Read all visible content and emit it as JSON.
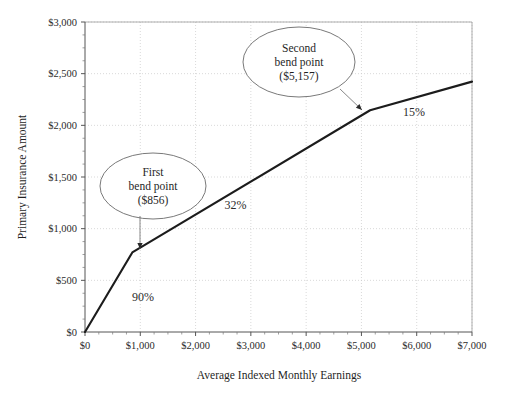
{
  "chart_data": {
    "type": "line",
    "title": "",
    "xlabel": "Average Indexed Monthly Earnings",
    "ylabel": "Primary Insurance Amount",
    "xlim": [
      0,
      7000
    ],
    "ylim": [
      0,
      3000
    ],
    "grid": true,
    "legend": "none",
    "x_tick_labels": [
      "$0",
      "$1,000",
      "$2,000",
      "$3,000",
      "$4,000",
      "$5,000",
      "$6,000",
      "$7,000"
    ],
    "x_tick_values": [
      0,
      1000,
      2000,
      3000,
      4000,
      5000,
      6000,
      7000
    ],
    "x_minor_step": 250,
    "y_tick_labels": [
      "$0",
      "$500",
      "$1,000",
      "$1,500",
      "$2,000",
      "$2,500",
      "$3,000"
    ],
    "y_tick_values": [
      0,
      500,
      1000,
      1500,
      2000,
      2500,
      3000
    ],
    "y_minor_step": 125,
    "series": [
      {
        "name": "Primary Insurance Amount",
        "color": "#1c1c1c",
        "x": [
          0,
          856,
          5157,
          7000
        ],
        "values": [
          0,
          770,
          2146,
          2423
        ]
      }
    ],
    "annotations": [
      {
        "name": "rate-90",
        "text": "90%",
        "x": 1050,
        "y": 300
      },
      {
        "name": "rate-32",
        "text": "32%",
        "x": 2720,
        "y": 1190
      },
      {
        "name": "rate-15",
        "text": "15%",
        "x": 5950,
        "y": 2090
      }
    ],
    "callouts": [
      {
        "name": "first-bend-point",
        "lines": [
          "First",
          "bend point",
          "($856)"
        ],
        "target_x": 856,
        "target_y": 770
      },
      {
        "name": "second-bend-point",
        "lines": [
          "Second",
          "bend point",
          "($5,157)"
        ],
        "target_x": 5157,
        "target_y": 2146
      }
    ]
  },
  "colors": {
    "series": "#1c1c1c",
    "grid": "#c9c9c9",
    "axis": "#555555",
    "callout_stroke": "#6a6a6a",
    "background": "#ffffff"
  }
}
